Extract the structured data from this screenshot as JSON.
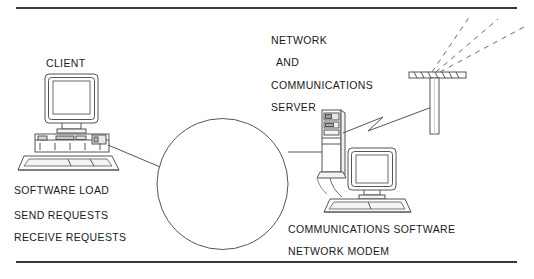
{
  "figure": {
    "type": "network-diagram",
    "background_color": "#ffffff",
    "line_color": "#555555",
    "text_color": "#1a1a1a",
    "rule_color": "#3a3a3a"
  },
  "labels": {
    "client": "CLIENT",
    "software_load": "SOFTWARE LOAD",
    "send_requests": "SEND REQUESTS",
    "receive_requests": "RECEIVE REQUESTS",
    "network": "NETWORK",
    "and": "AND",
    "communications": "COMMUNICATIONS",
    "server": "SERVER",
    "communications_software": "COMMUNICATIONS SOFTWARE",
    "network_modem": "NETWORK MODEM"
  },
  "nodes": [
    {
      "id": "client-workstation",
      "icon": "desktop-computer-icon",
      "label": "CLIENT",
      "notes": [
        "SOFTWARE LOAD",
        "SEND REQUESTS",
        "RECEIVE REQUESTS"
      ]
    },
    {
      "id": "network-cloud",
      "icon": "network-circle-icon",
      "label": ""
    },
    {
      "id": "server-tower",
      "icon": "tower-server-icon",
      "label": "NETWORK AND COMMUNICATIONS SERVER"
    },
    {
      "id": "server-workstation",
      "icon": "desktop-computer-icon",
      "label": "",
      "notes": [
        "COMMUNICATIONS SOFTWARE",
        "NETWORK MODEM"
      ]
    },
    {
      "id": "transmission-tower",
      "icon": "antenna-tower-icon",
      "label": "",
      "signal_beams": 3
    }
  ],
  "connections": [
    {
      "from": "client-workstation",
      "to": "network-cloud",
      "style": "solid"
    },
    {
      "from": "network-cloud",
      "to": "server-tower",
      "style": "solid"
    },
    {
      "from": "server-tower",
      "to": "transmission-tower",
      "style": "lightning"
    },
    {
      "from": "transmission-tower",
      "to": "air",
      "style": "dashed"
    }
  ]
}
